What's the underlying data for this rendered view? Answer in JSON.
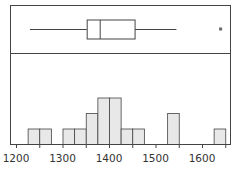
{
  "chart_data": [
    {
      "type": "box",
      "title": "",
      "orientation": "horizontal",
      "whisker_low": 1230,
      "q1": 1352,
      "median": 1380,
      "q3": 1455,
      "whisker_high": 1545,
      "outliers": [
        1640
      ],
      "xlim": [
        1180,
        1660
      ]
    },
    {
      "type": "bar",
      "subtype": "histogram",
      "title": "",
      "xlabel": "",
      "ylabel": "",
      "bin_width": 25,
      "bins": [
        {
          "start": 1225,
          "end": 1250,
          "count": 1
        },
        {
          "start": 1250,
          "end": 1275,
          "count": 1
        },
        {
          "start": 1300,
          "end": 1325,
          "count": 1
        },
        {
          "start": 1325,
          "end": 1350,
          "count": 1
        },
        {
          "start": 1350,
          "end": 1375,
          "count": 2
        },
        {
          "start": 1375,
          "end": 1400,
          "count": 3
        },
        {
          "start": 1400,
          "end": 1425,
          "count": 3
        },
        {
          "start": 1425,
          "end": 1450,
          "count": 1
        },
        {
          "start": 1450,
          "end": 1475,
          "count": 1
        },
        {
          "start": 1525,
          "end": 1550,
          "count": 2
        },
        {
          "start": 1625,
          "end": 1650,
          "count": 1
        }
      ],
      "xticks": [
        1200,
        1300,
        1400,
        1500,
        1600
      ],
      "xtick_labels": [
        "1200",
        "1300",
        "1400",
        "1500",
        "1600"
      ],
      "xlim": [
        1180,
        1660
      ],
      "grid": false
    }
  ],
  "style": {
    "bar_fill": "#e8e8e8",
    "stroke": "#444444",
    "outlier_color": "#666666"
  }
}
